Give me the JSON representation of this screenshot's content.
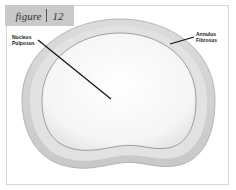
{
  "figure": {
    "label_word": "figure",
    "label_number": "12"
  },
  "callouts": {
    "nucleus_line1": "Nucleus",
    "nucleus_line2": "Pulposus",
    "annulus_line1": "Annulus",
    "annulus_line2": "Fibrosus"
  },
  "colors": {
    "label_bg": "#c9c9c9",
    "annulus_fill": "#d3d3d3",
    "nucleus_fill": "#f4f4f4",
    "frame_border": "#d6d6d6",
    "leader_line": "#111111"
  }
}
